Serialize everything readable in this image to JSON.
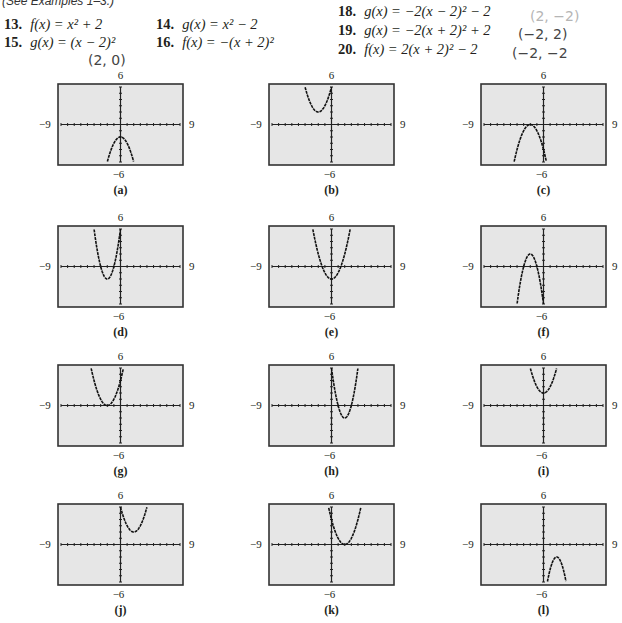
{
  "header_note": "(See Examples 1–3.)",
  "exercises": [
    {
      "num": "13.",
      "eq": "f(x) = x² + 2"
    },
    {
      "num": "14.",
      "eq": "g(x) = x² − 2"
    },
    {
      "num": "15.",
      "eq": "g(x) = (x − 2)²"
    },
    {
      "num": "16.",
      "eq": "f(x) = −(x + 2)²"
    },
    {
      "num": "18.",
      "eq": "g(x) = −2(x − 2)² − 2"
    },
    {
      "num": "19.",
      "eq": "g(x) = −2(x + 2)² + 2"
    },
    {
      "num": "20.",
      "eq": "f(x) = 2(x + 2)² − 2"
    }
  ],
  "handwritten": {
    "ex15": "(2, 0)",
    "ex18": "(2, −2)",
    "ex19": "(−2, 2)",
    "ex20": "(−2, −2"
  },
  "window": {
    "xmin": "−9",
    "xmax": "9",
    "ymin": "−6",
    "ymax": "6"
  },
  "chart_data": [
    {
      "type": "line",
      "label": "(a)",
      "title": "",
      "xlim": [
        -9,
        9
      ],
      "ylim": [
        -6,
        6
      ],
      "a": -1,
      "h": 0,
      "k": -2,
      "xlabel": "",
      "ylabel": ""
    },
    {
      "type": "line",
      "label": "(b)",
      "title": "",
      "xlim": [
        -9,
        9
      ],
      "ylim": [
        -6,
        6
      ],
      "a": 1,
      "h": -2,
      "k": 2,
      "xlabel": "",
      "ylabel": ""
    },
    {
      "type": "line",
      "label": "(c)",
      "title": "",
      "xlim": [
        -9,
        9
      ],
      "ylim": [
        -6,
        6
      ],
      "a": -1,
      "h": -2,
      "k": 0,
      "xlabel": "",
      "ylabel": ""
    },
    {
      "type": "line",
      "label": "(d)",
      "title": "",
      "xlim": [
        -9,
        9
      ],
      "ylim": [
        -6,
        6
      ],
      "a": 2,
      "h": -2,
      "k": -2,
      "xlabel": "",
      "ylabel": ""
    },
    {
      "type": "line",
      "label": "(e)",
      "title": "",
      "xlim": [
        -9,
        9
      ],
      "ylim": [
        -6,
        6
      ],
      "a": 1,
      "h": 0,
      "k": -2,
      "xlabel": "",
      "ylabel": ""
    },
    {
      "type": "line",
      "label": "(f)",
      "title": "",
      "xlim": [
        -9,
        9
      ],
      "ylim": [
        -6,
        6
      ],
      "a": -2,
      "h": -2,
      "k": 2,
      "xlabel": "",
      "ylabel": ""
    },
    {
      "type": "line",
      "label": "(g)",
      "title": "",
      "xlim": [
        -9,
        9
      ],
      "ylim": [
        -6,
        6
      ],
      "a": 1,
      "h": -2,
      "k": 0,
      "xlabel": "",
      "ylabel": ""
    },
    {
      "type": "line",
      "label": "(h)",
      "title": "",
      "xlim": [
        -9,
        9
      ],
      "ylim": [
        -6,
        6
      ],
      "a": 2,
      "h": 2,
      "k": -2,
      "xlabel": "",
      "ylabel": ""
    },
    {
      "type": "line",
      "label": "(i)",
      "title": "",
      "xlim": [
        -9,
        9
      ],
      "ylim": [
        -6,
        6
      ],
      "a": 1,
      "h": 0,
      "k": 2,
      "xlabel": "",
      "ylabel": ""
    },
    {
      "type": "line",
      "label": "(j)",
      "title": "",
      "xlim": [
        -9,
        9
      ],
      "ylim": [
        -6,
        6
      ],
      "a": 1,
      "h": 2,
      "k": 2,
      "xlabel": "",
      "ylabel": ""
    },
    {
      "type": "line",
      "label": "(k)",
      "title": "",
      "xlim": [
        -9,
        9
      ],
      "ylim": [
        -6,
        6
      ],
      "a": 1,
      "h": 2,
      "k": 0,
      "xlabel": "",
      "ylabel": ""
    },
    {
      "type": "line",
      "label": "(l)",
      "title": "",
      "xlim": [
        -9,
        9
      ],
      "ylim": [
        -6,
        6
      ],
      "a": -2,
      "h": 2,
      "k": -2,
      "xlabel": "",
      "ylabel": ""
    }
  ]
}
